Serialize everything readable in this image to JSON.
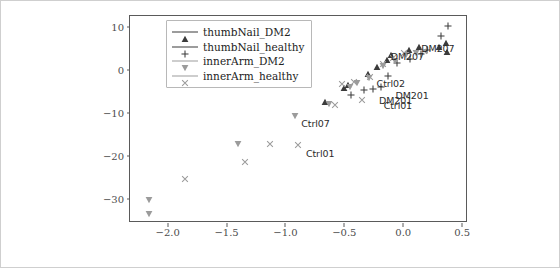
{
  "figure": {
    "background": "#ffffff",
    "frame_color": "#5a5a5a"
  },
  "chart_data": {
    "type": "scatter",
    "title": "",
    "xlabel": "",
    "ylabel": "",
    "xlim": [
      -2.32,
      0.55
    ],
    "ylim": [
      -35.5,
      12.5
    ],
    "xticks": [
      -2.0,
      -1.5,
      -1.0,
      -0.5,
      0.0,
      0.5
    ],
    "xticklabels": [
      "−2.0",
      "−1.5",
      "−1.0",
      "−0.5",
      "0.0",
      "0.5"
    ],
    "yticks": [
      10,
      0,
      -10,
      -20,
      -30
    ],
    "yticklabels": [
      "10",
      "0",
      "−10",
      "−20",
      "−30"
    ],
    "grid": false,
    "legend_position": "upper left",
    "colors": {
      "dark": "#3b3b3b",
      "gray": "#9b9b9b"
    },
    "series": [
      {
        "name": "thumbNail_DM2",
        "marker": "triangle-up",
        "color": "#3b3b3b",
        "points": [
          {
            "x": -0.66,
            "y": -7.4
          },
          {
            "x": -0.5,
            "y": -4.3
          },
          {
            "x": -0.47,
            "y": -3.4
          },
          {
            "x": -0.3,
            "y": -1.0
          },
          {
            "x": -0.22,
            "y": 0.6
          },
          {
            "x": -0.14,
            "y": 2.2
          },
          {
            "x": -0.1,
            "y": 3.4
          },
          {
            "x": 0.05,
            "y": 4.6
          },
          {
            "x": 0.13,
            "y": 5.3
          },
          {
            "x": 0.3,
            "y": 5.4
          },
          {
            "x": 0.36,
            "y": 6.2
          },
          {
            "x": 0.37,
            "y": 4.2
          }
        ]
      },
      {
        "name": "thumbNail_healthy",
        "marker": "plus",
        "color": "#3b3b3b",
        "points": [
          {
            "x": -0.44,
            "y": -5.9
          },
          {
            "x": -0.33,
            "y": -4.6
          },
          {
            "x": -0.26,
            "y": -4.4
          },
          {
            "x": -0.19,
            "y": -3.9
          },
          {
            "x": -0.13,
            "y": -1.4
          },
          {
            "x": -0.05,
            "y": 1.5
          },
          {
            "x": 0.06,
            "y": 2.6
          },
          {
            "x": 0.15,
            "y": 3.6
          },
          {
            "x": 0.2,
            "y": 4.7
          },
          {
            "x": 0.32,
            "y": 7.9
          },
          {
            "x": 0.38,
            "y": 10.2
          }
        ]
      },
      {
        "name": "innerArm_DM2",
        "marker": "triangle-down",
        "color": "#9b9b9b",
        "points": [
          {
            "x": -2.16,
            "y": -30.1
          },
          {
            "x": -2.16,
            "y": -33.3
          },
          {
            "x": -1.4,
            "y": -17.1
          },
          {
            "x": -0.92,
            "y": -10.6
          },
          {
            "x": -0.63,
            "y": -7.8
          },
          {
            "x": -0.45,
            "y": -4.0
          },
          {
            "x": -0.39,
            "y": -3.1
          },
          {
            "x": -0.29,
            "y": -1.9
          },
          {
            "x": -0.17,
            "y": 0.9
          },
          {
            "x": -0.07,
            "y": 2.1
          },
          {
            "x": 0.02,
            "y": 3.5
          },
          {
            "x": 0.11,
            "y": 4.0
          }
        ]
      },
      {
        "name": "innerArm_healthy",
        "marker": "x",
        "color": "#9b9b9b",
        "points": [
          {
            "x": -1.85,
            "y": -25.3
          },
          {
            "x": -1.34,
            "y": -21.3
          },
          {
            "x": -1.13,
            "y": -17.1
          },
          {
            "x": -0.89,
            "y": -17.4
          },
          {
            "x": -0.58,
            "y": -8.1
          },
          {
            "x": -0.52,
            "y": -3.2
          },
          {
            "x": -0.42,
            "y": -2.9
          },
          {
            "x": -0.35,
            "y": -6.9
          },
          {
            "x": -0.28,
            "y": -1.6
          },
          {
            "x": -0.17,
            "y": 1.4
          },
          {
            "x": -0.09,
            "y": 2.8
          },
          {
            "x": 0.01,
            "y": 3.9
          },
          {
            "x": 0.18,
            "y": 4.4
          }
        ]
      }
    ],
    "annotations": [
      {
        "text": "Ctrl07",
        "x": -0.9,
        "y": -12.5
      },
      {
        "text": "Ctrl01",
        "x": -0.86,
        "y": -19.6
      },
      {
        "text": "Ctrl02",
        "x": -0.26,
        "y": -3.2
      },
      {
        "text": "Ctrl01",
        "x": -0.2,
        "y": -8.4
      },
      {
        "text": "DM201",
        "x": -0.24,
        "y": -7.3
      },
      {
        "text": "DM201",
        "x": -0.1,
        "y": -6.0
      },
      {
        "text": "DM207",
        "x": -0.14,
        "y": 3.0
      },
      {
        "text": "DM207",
        "x": 0.12,
        "y": 4.9
      }
    ]
  },
  "legend": {
    "entries": [
      {
        "label": "thumbNail_DM2"
      },
      {
        "label": "thumbNail_healthy"
      },
      {
        "label": "innerArm_DM2"
      },
      {
        "label": "innerArm_healthy"
      }
    ]
  }
}
